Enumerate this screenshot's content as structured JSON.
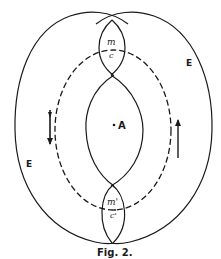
{
  "figure": {
    "caption": "Fig. 2.",
    "labels": {
      "top_m": "m",
      "top_c": "c",
      "bottom_m": "m'",
      "bottom_c": "c'",
      "center": "A",
      "right_E": "E",
      "left_E": "E"
    },
    "colors": {
      "ink": "#1a1a1a",
      "background": "#ffffff"
    }
  }
}
